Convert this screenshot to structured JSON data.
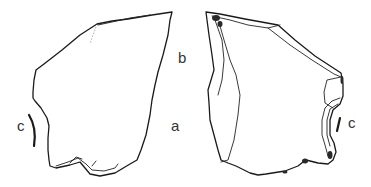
{
  "figure": {
    "type": "lithic-artifact-illustration",
    "views": [
      {
        "id": "view-ventral",
        "position": "left"
      },
      {
        "id": "view-dorsal",
        "position": "right"
      }
    ],
    "labels": {
      "a": "a",
      "b": "b",
      "c_left": "c",
      "c_right": "c"
    },
    "colors": {
      "line": "#1a1a1a",
      "background": "#ffffff",
      "label": "#333333"
    }
  }
}
